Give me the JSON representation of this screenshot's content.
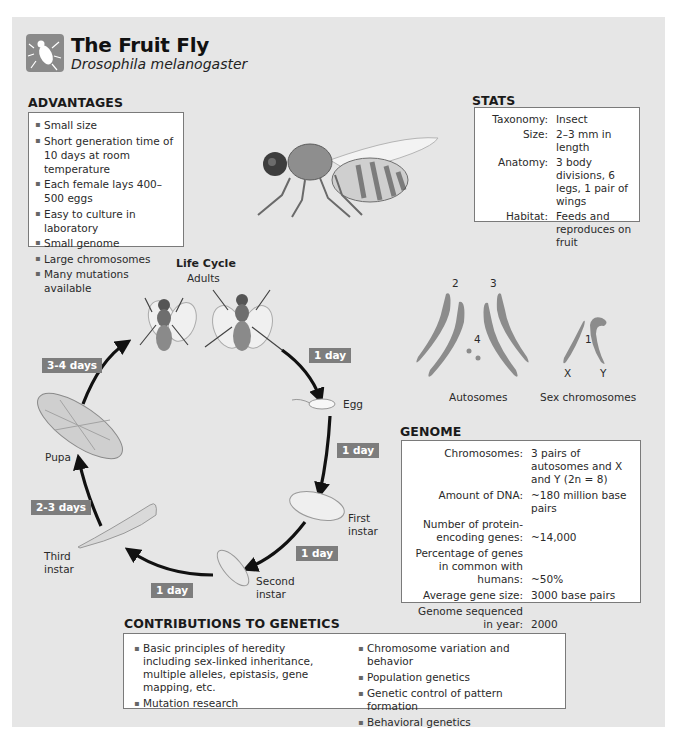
{
  "header": {
    "title": "The Fruit Fly",
    "subtitle": "Drosophila melanogaster",
    "logo_icon": "fly-icon"
  },
  "advantages": {
    "heading": "ADVANTAGES",
    "items": [
      "Small size",
      "Short generation time of 10 days at room temperature",
      "Each female lays 400–500 eggs",
      "Easy to culture in laboratory",
      "Small genome",
      "Large chromosomes",
      "Many mutations available"
    ]
  },
  "stats": {
    "heading": "STATS",
    "rows": [
      {
        "label": "Taxonomy:",
        "value": "Insect"
      },
      {
        "label": "Size:",
        "value": "2–3 mm in length"
      },
      {
        "label": "Anatomy:",
        "value": "3 body divisions, 6 legs, 1 pair of wings"
      },
      {
        "label": "Habitat:",
        "value": "Feeds and reproduces on fruit"
      }
    ]
  },
  "life_cycle": {
    "heading": "Life Cycle",
    "stages": {
      "adults": "Adults",
      "egg": "Egg",
      "first_instar": "First instar",
      "second_instar": "Second instar",
      "third_instar": "Third instar",
      "pupa": "Pupa"
    },
    "durations": {
      "adults_to_egg": "1 day",
      "egg_to_first": "1 day",
      "first_to_second": "1 day",
      "second_to_third": "1 day",
      "third_to_pupa": "2-3 days",
      "pupa_to_adults": "3-4 days"
    }
  },
  "chromosomes": {
    "autosome_numbers": [
      "2",
      "3",
      "4"
    ],
    "sex_number": "1",
    "x_label": "X",
    "y_label": "Y",
    "autosomes_caption": "Autosomes",
    "sex_caption": "Sex chromosomes"
  },
  "genome": {
    "heading": "GENOME",
    "rows": [
      {
        "label": "Chromosomes:",
        "value": "3 pairs of autosomes and X and Y (2n = 8)"
      },
      {
        "label": "Amount of DNA:",
        "value": "~180 million base pairs"
      },
      {
        "label": "Number of protein-encoding genes:",
        "value": "~14,000"
      },
      {
        "label": "Percentage of genes in common with humans:",
        "value": "~50%"
      },
      {
        "label": "Average gene size:",
        "value": "3000 base pairs"
      },
      {
        "label": "Genome sequenced in year:",
        "value": "2000"
      }
    ]
  },
  "contributions": {
    "heading": "CONTRIBUTIONS TO GENETICS",
    "left": [
      "Basic principles of heredity including sex-linked inheritance, multiple alleles, epistasis, gene mapping, etc.",
      "Mutation research"
    ],
    "right": [
      "Chromosome variation and behavior",
      "Population genetics",
      "Genetic control of pattern formation",
      "Behavioral genetics"
    ]
  },
  "colors": {
    "panel": "#e6e6e6",
    "tag": "#7d7d7d",
    "chromosome": "#8c8c8c"
  }
}
